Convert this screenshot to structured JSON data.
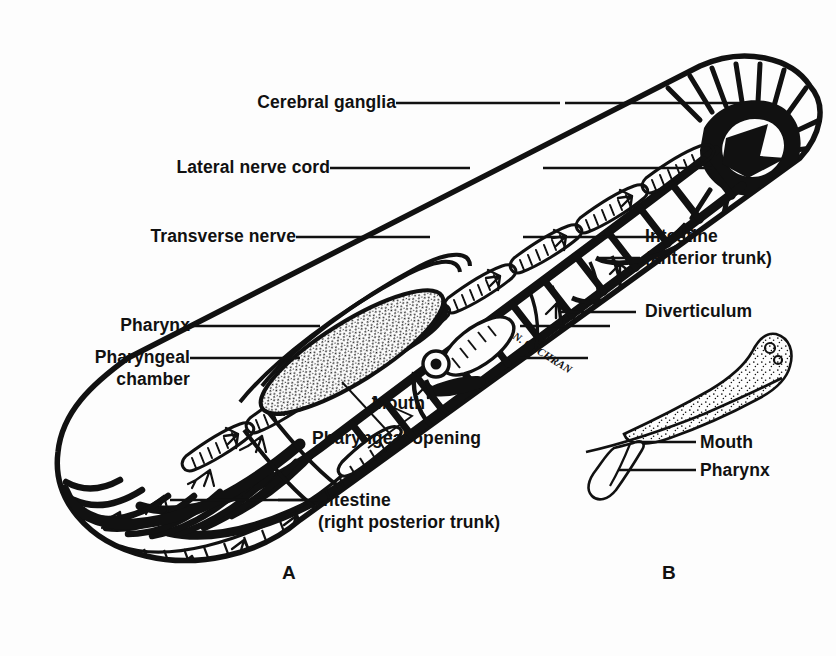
{
  "figure": {
    "background_color": "#fdfdfd",
    "ink_color": "#111111",
    "artist_signature": "N. COCHRAN"
  },
  "panels": [
    {
      "id": "A",
      "letter": "A",
      "description": "Dorsal view of entire worm showing nervous system, pharynx and intestine"
    },
    {
      "id": "B",
      "letter": "B",
      "description": "Detail of everted proboscis / pharynx region"
    }
  ],
  "labels": [
    {
      "id": "cerebral-ganglia",
      "text": "Cerebral ganglia",
      "align": "right",
      "panel": "A"
    },
    {
      "id": "lateral-nerve-cord",
      "text": "Lateral nerve cord",
      "align": "right",
      "panel": "A"
    },
    {
      "id": "transverse-nerve",
      "text": "Transverse nerve",
      "align": "right",
      "panel": "A"
    },
    {
      "id": "pharynx",
      "text": "Pharynx",
      "align": "right",
      "panel": "A"
    },
    {
      "id": "pharyngeal-chamber-line1",
      "text": "Pharyngeal",
      "align": "right",
      "panel": "A"
    },
    {
      "id": "pharyngeal-chamber-line2",
      "text": "chamber",
      "align": "right",
      "panel": "A"
    },
    {
      "id": "intestine-anterior-line1",
      "text": "Intestine",
      "align": "left",
      "panel": "A"
    },
    {
      "id": "intestine-anterior-line2",
      "text": "(anterior trunk)",
      "align": "left",
      "panel": "A"
    },
    {
      "id": "diverticulum",
      "text": "Diverticulum",
      "align": "left",
      "panel": "A"
    },
    {
      "id": "mouth-a",
      "text": "Mouth",
      "align": "left",
      "panel": "A"
    },
    {
      "id": "pharyngeal-opening",
      "text": "Pharyngeal opening",
      "align": "left",
      "panel": "A"
    },
    {
      "id": "intestine-posterior-line1",
      "text": "Intestine",
      "align": "left",
      "panel": "A"
    },
    {
      "id": "intestine-posterior-line2",
      "text": "(right posterior trunk)",
      "align": "left",
      "panel": "A"
    },
    {
      "id": "mouth-b",
      "text": "Mouth",
      "align": "left",
      "panel": "B"
    },
    {
      "id": "pharynx-b",
      "text": "Pharynx",
      "align": "left",
      "panel": "B"
    }
  ]
}
